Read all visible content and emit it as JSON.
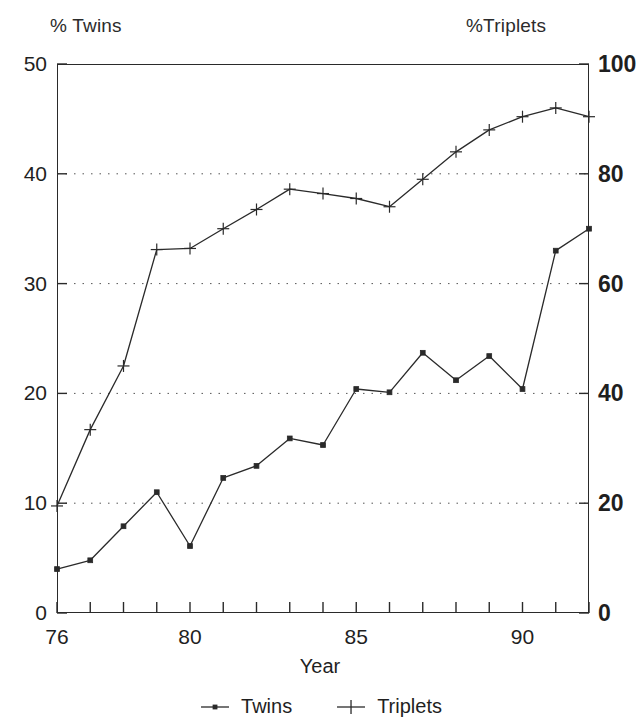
{
  "headers": {
    "left_axis": "% Twins",
    "right_axis": "%Triplets"
  },
  "chart_data": {
    "type": "line",
    "title": "",
    "xlabel": "Year",
    "grid": "horizontal-dotted",
    "legend_position": "bottom",
    "x": [
      76,
      77,
      78,
      79,
      80,
      81,
      82,
      83,
      84,
      85,
      86,
      87,
      88,
      89,
      90,
      91,
      92
    ],
    "x_tick_labels_shown": [
      "76",
      "80",
      "85",
      "90"
    ],
    "xlim": [
      76,
      92
    ],
    "axes": [
      {
        "id": "left",
        "label": "% Twins",
        "ticks": [
          0,
          10,
          20,
          30,
          40,
          50
        ],
        "lim": [
          0,
          50
        ],
        "series": "Twins"
      },
      {
        "id": "right",
        "label": "%Triplets",
        "ticks": [
          0,
          20,
          40,
          60,
          80,
          100
        ],
        "lim": [
          0,
          100
        ],
        "series": "Triplets"
      }
    ],
    "series": [
      {
        "name": "Twins",
        "axis": "left",
        "marker": "square-dot",
        "values": [
          4.0,
          4.8,
          7.9,
          11.0,
          6.1,
          12.3,
          13.4,
          15.9,
          15.3,
          20.4,
          20.1,
          23.7,
          21.2,
          23.4,
          20.4,
          33.0,
          35.0
        ]
      },
      {
        "name": "Triplets",
        "axis": "right",
        "marker": "plus",
        "values": [
          19.5,
          33.4,
          45.0,
          66.2,
          66.4,
          70.0,
          73.5,
          77.2,
          76.4,
          75.5,
          74.0,
          79.0,
          84.0,
          88.0,
          90.4,
          92.0,
          90.4
        ],
        "values_in_left_axis_units": [
          9.75,
          16.7,
          22.5,
          33.1,
          33.2,
          35.0,
          36.75,
          38.6,
          38.2,
          37.75,
          37.0,
          39.5,
          42.0,
          44.0,
          45.2,
          46.0,
          45.2
        ]
      }
    ],
    "legend": [
      {
        "name": "Twins",
        "marker": "square-dot"
      },
      {
        "name": "Triplets",
        "marker": "plus"
      }
    ]
  },
  "colors": {
    "line": "#2a2a2a",
    "grid": "#555555",
    "frame": "#2a2a2a",
    "text": "#1f1f1f",
    "background": "#ffffff"
  }
}
